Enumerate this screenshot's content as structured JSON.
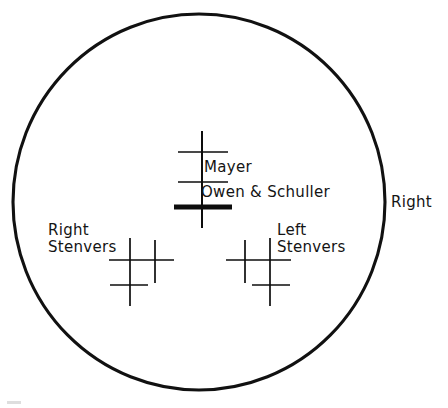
{
  "figure": {
    "type": "anatomical-projection-diagram",
    "ink_color": "#0d0d0d",
    "background_color": "#ffffff"
  },
  "outline": {
    "shape": "circle",
    "name": "head-outline",
    "center_x": 199,
    "center_y": 202,
    "radius_x": 186,
    "radius_y": 188,
    "stroke_width": 3.1
  },
  "side_labels": [
    {
      "id": "right-side",
      "text": "Right"
    }
  ],
  "markers": [
    {
      "id": "central",
      "name": "central-projection-marker",
      "labels": [
        {
          "id": "mayer",
          "text": "Mayer"
        },
        {
          "id": "owen-schuller",
          "text": "Owen & Schuller"
        }
      ],
      "vertical_lines": [
        {
          "x": 202,
          "y1": 131,
          "y2": 228,
          "weight": "med"
        }
      ],
      "horizontal_lines": [
        {
          "y": 152,
          "x1": 178,
          "x2": 228,
          "weight": "thin"
        },
        {
          "y": 182,
          "x1": 178,
          "x2": 228,
          "weight": "thin"
        },
        {
          "y": 207,
          "x1": 174,
          "x2": 232,
          "weight": "bold"
        }
      ]
    },
    {
      "id": "right-stenvers",
      "name": "right-stenvers-marker",
      "labels": [
        {
          "id": "right-stenvers",
          "text": "Right\nStenvers"
        }
      ],
      "vertical_lines": [
        {
          "x": 130,
          "y1": 238,
          "y2": 306,
          "weight": "thin"
        },
        {
          "x": 155,
          "y1": 240,
          "y2": 283,
          "weight": "thin"
        }
      ],
      "horizontal_lines": [
        {
          "y": 260,
          "x1": 109,
          "x2": 174,
          "weight": "thin"
        },
        {
          "y": 285,
          "x1": 110,
          "x2": 148,
          "weight": "thin"
        }
      ]
    },
    {
      "id": "left-stenvers",
      "name": "left-stenvers-marker",
      "labels": [
        {
          "id": "left-stenvers",
          "text": "Left\nStenvers"
        }
      ],
      "vertical_lines": [
        {
          "x": 270,
          "y1": 238,
          "y2": 306,
          "weight": "thin"
        },
        {
          "x": 245,
          "y1": 240,
          "y2": 283,
          "weight": "thin"
        }
      ],
      "horizontal_lines": [
        {
          "y": 260,
          "x1": 226,
          "x2": 291,
          "weight": "thin"
        },
        {
          "y": 285,
          "x1": 252,
          "x2": 290,
          "weight": "thin"
        }
      ]
    }
  ]
}
